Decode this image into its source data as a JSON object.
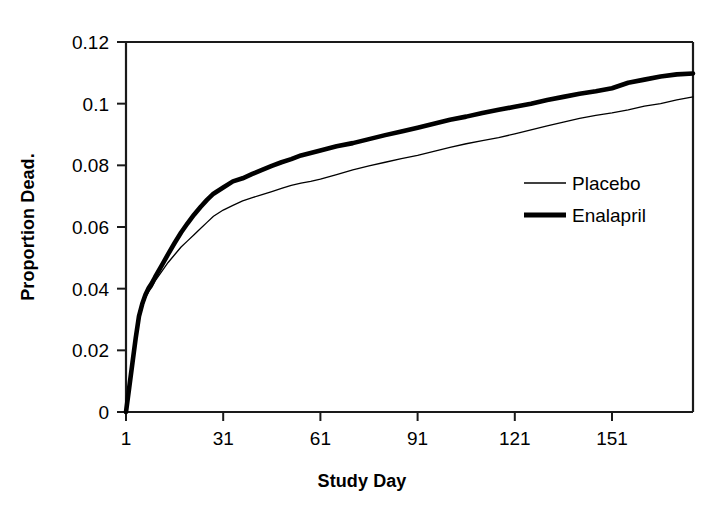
{
  "chart_data": {
    "type": "line",
    "title": "",
    "subtitle": "",
    "xlabel": "Study Day",
    "ylabel": "Proportion Dead.",
    "xlim": [
      1,
      176
    ],
    "ylim": [
      0,
      0.12
    ],
    "grid": false,
    "x_ticks": [
      "1",
      "31",
      "61",
      "91",
      "121",
      "151"
    ],
    "x_tick_values": [
      1,
      31,
      61,
      91,
      121,
      151
    ],
    "y_ticks": [
      "0",
      "0.02",
      "0.04",
      "0.06",
      "0.08",
      "0.1",
      "0.12"
    ],
    "y_tick_values": [
      0,
      0.02,
      0.04,
      0.06,
      0.08,
      0.1,
      0.12
    ],
    "legend_position": "center-right",
    "annotations": [],
    "x": [
      1,
      2,
      3,
      4,
      5,
      6,
      7,
      8,
      9,
      10,
      12,
      14,
      16,
      18,
      20,
      22,
      24,
      26,
      28,
      31,
      34,
      37,
      40,
      43,
      46,
      49,
      52,
      55,
      58,
      61,
      66,
      71,
      76,
      81,
      86,
      91,
      96,
      101,
      106,
      111,
      116,
      121,
      126,
      131,
      136,
      141,
      146,
      151,
      156,
      161,
      166,
      171,
      176
    ],
    "series": [
      {
        "name": "Placebo",
        "line_style": "thin",
        "color": "#000000",
        "line_width": 1.3,
        "values": [
          0,
          0.008,
          0.016,
          0.024,
          0.03,
          0.034,
          0.037,
          0.039,
          0.0405,
          0.0425,
          0.0455,
          0.0485,
          0.051,
          0.0535,
          0.0555,
          0.0575,
          0.0595,
          0.0615,
          0.0635,
          0.0655,
          0.067,
          0.0685,
          0.0695,
          0.0705,
          0.0715,
          0.0725,
          0.0735,
          0.0742,
          0.0748,
          0.0755,
          0.077,
          0.0785,
          0.0798,
          0.081,
          0.0822,
          0.0832,
          0.0845,
          0.0858,
          0.087,
          0.088,
          0.089,
          0.0902,
          0.0915,
          0.0928,
          0.094,
          0.0952,
          0.0962,
          0.097,
          0.098,
          0.0992,
          0.1,
          0.1012,
          0.1022
        ]
      },
      {
        "name": "Enalapril",
        "line_style": "thick",
        "color": "#000000",
        "line_width": 4.6,
        "values": [
          0,
          0.008,
          0.016,
          0.024,
          0.031,
          0.035,
          0.038,
          0.0402,
          0.0418,
          0.0438,
          0.0475,
          0.0512,
          0.0548,
          0.0582,
          0.0612,
          0.064,
          0.0665,
          0.0688,
          0.0708,
          0.0728,
          0.0748,
          0.0758,
          0.0772,
          0.0785,
          0.0798,
          0.081,
          0.082,
          0.0832,
          0.084,
          0.0848,
          0.0862,
          0.0872,
          0.0885,
          0.0898,
          0.091,
          0.0922,
          0.0935,
          0.0948,
          0.0958,
          0.097,
          0.098,
          0.099,
          0.1,
          0.1012,
          0.1022,
          0.1032,
          0.104,
          0.105,
          0.1068,
          0.1078,
          0.1088,
          0.1095,
          0.1098
        ]
      }
    ]
  },
  "legend": {
    "entries": [
      {
        "label": "Placebo",
        "style": "thin"
      },
      {
        "label": "Enalapril",
        "style": "thick"
      }
    ]
  }
}
